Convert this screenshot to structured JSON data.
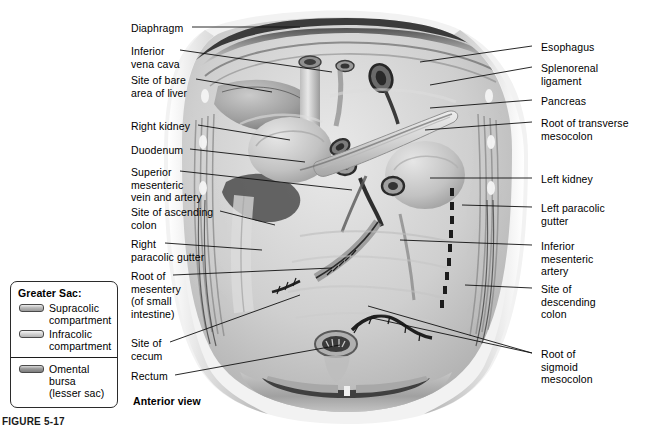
{
  "figure": {
    "view_caption": "Anterior view",
    "figure_number": "FIGURE 5-17"
  },
  "legend": {
    "title": "Greater Sac:",
    "items": [
      {
        "label": "Supracolic\ncompartment",
        "color": "#b9b9b9",
        "group": "greater-sac"
      },
      {
        "label": "Infracolic\ncompartment",
        "color": "#cfcfcf",
        "group": "greater-sac"
      },
      {
        "label": "Omental\nbursa\n(lesser sac)",
        "color": "#9a9a9a",
        "group": "omental-bursa"
      }
    ]
  },
  "labels_left": [
    {
      "name": "diaphragm",
      "text": "Diaphragm",
      "x": 131,
      "y": 22,
      "line_x1": 192,
      "line_y1": 27,
      "line_x2": 300,
      "line_y2": 27
    },
    {
      "name": "inferior-vena-cava",
      "text": "Inferior\nvena cava",
      "x": 131,
      "y": 45,
      "line_x1": 180,
      "line_y1": 50,
      "line_x2": 332,
      "line_y2": 72
    },
    {
      "name": "site-of-bare-area-of-liver",
      "text": "Site of bare\narea of liver",
      "x": 131,
      "y": 74,
      "line_x1": 196,
      "line_y1": 79,
      "line_x2": 272,
      "line_y2": 92
    },
    {
      "name": "right-kidney",
      "text": "Right kidney",
      "x": 131,
      "y": 120,
      "line_x1": 198,
      "line_y1": 125,
      "line_x2": 290,
      "line_y2": 140
    },
    {
      "name": "duodenum",
      "text": "Duodenum",
      "x": 131,
      "y": 144,
      "line_x1": 190,
      "line_y1": 149,
      "line_x2": 305,
      "line_y2": 162
    },
    {
      "name": "superior-mesenteric-vein-and-artery",
      "text": "Superior\nmesenteric\nvein and artery",
      "x": 131,
      "y": 166,
      "line_x1": 180,
      "line_y1": 171,
      "line_x2": 352,
      "line_y2": 190
    },
    {
      "name": "site-of-ascending-colon",
      "text": "Site of ascending\ncolon",
      "x": 131,
      "y": 206,
      "line_x1": 220,
      "line_y1": 211,
      "line_x2": 275,
      "line_y2": 225
    },
    {
      "name": "right-paracolic-gutter",
      "text": "Right\nparacolic gutter",
      "x": 131,
      "y": 238,
      "line_x1": 165,
      "line_y1": 243,
      "line_x2": 262,
      "line_y2": 250
    },
    {
      "name": "root-of-mesentery",
      "text": "Root of\nmesentery\n(of small\nintestine)",
      "x": 131,
      "y": 270,
      "line_x1": 173,
      "line_y1": 275,
      "line_x2": 332,
      "line_y2": 268
    },
    {
      "name": "site-of-cecum",
      "text": "Site of\ncecum",
      "x": 131,
      "y": 337,
      "line_x1": 170,
      "line_y1": 342,
      "line_x2": 300,
      "line_y2": 295
    },
    {
      "name": "rectum",
      "text": "Rectum",
      "x": 131,
      "y": 370,
      "line_x1": 175,
      "line_y1": 375,
      "line_x2": 340,
      "line_y2": 345
    }
  ],
  "labels_right": [
    {
      "name": "esophagus",
      "text": "Esophagus",
      "x": 541,
      "y": 41,
      "line_x1": 532,
      "line_y1": 46,
      "line_x2": 420,
      "line_y2": 62
    },
    {
      "name": "splenorenal-ligament",
      "text": "Splenorenal\nligament",
      "x": 541,
      "y": 62,
      "line_x1": 532,
      "line_y1": 67,
      "line_x2": 430,
      "line_y2": 85
    },
    {
      "name": "pancreas",
      "text": "Pancreas",
      "x": 541,
      "y": 95,
      "line_x1": 532,
      "line_y1": 100,
      "line_x2": 430,
      "line_y2": 108
    },
    {
      "name": "root-of-transverse-mesocolon",
      "text": "Root of transverse\nmesocolon",
      "x": 541,
      "y": 117,
      "line_x1": 532,
      "line_y1": 122,
      "line_x2": 425,
      "line_y2": 130
    },
    {
      "name": "left-kidney",
      "text": "Left kidney",
      "x": 541,
      "y": 173,
      "line_x1": 532,
      "line_y1": 178,
      "line_x2": 430,
      "line_y2": 178
    },
    {
      "name": "left-paracolic-gutter",
      "text": "Left paracolic\ngutter",
      "x": 541,
      "y": 202,
      "line_x1": 532,
      "line_y1": 207,
      "line_x2": 462,
      "line_y2": 205
    },
    {
      "name": "inferior-mesenteric-artery",
      "text": "Inferior\nmesenteric\nartery",
      "x": 541,
      "y": 240,
      "line_x1": 532,
      "line_y1": 245,
      "line_x2": 400,
      "line_y2": 240
    },
    {
      "name": "site-of-descending-colon",
      "text": "Site of\ndescending\ncolon",
      "x": 541,
      "y": 283,
      "line_x1": 532,
      "line_y1": 288,
      "line_x2": 465,
      "line_y2": 285
    },
    {
      "name": "root-of-sigmoid-mesocolon",
      "text": "Root of\nsigmoid\nmesocolon",
      "x": 541,
      "y": 348,
      "line_x1": 532,
      "line_y1": 353,
      "line_x2": 372,
      "line_y2": 318
    }
  ]
}
